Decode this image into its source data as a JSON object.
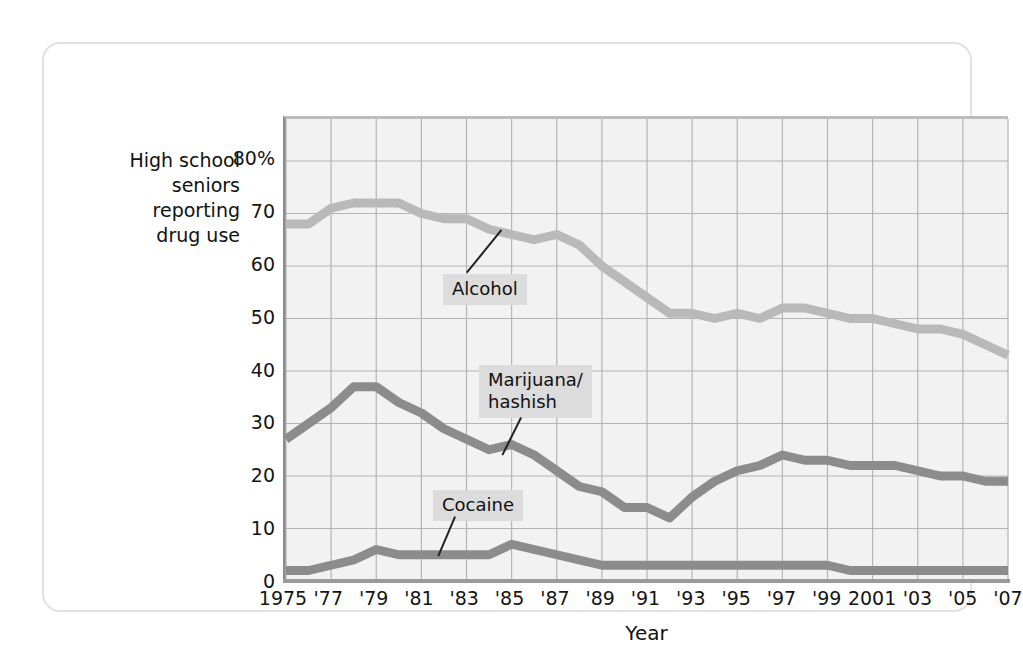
{
  "figure": {
    "y_axis_title": "High school\nseniors\nreporting\ndrug use",
    "x_axis_title": "Year",
    "frame_color": "#e2e2e2",
    "plot_background": "#f2f2f2",
    "grid_color": "#b4b4b4"
  },
  "callouts": {
    "alcohol": "Alcohol",
    "marijuana": "Marijuana/\nhashish",
    "cocaine": "Cocaine"
  },
  "chart_data": {
    "type": "line",
    "title": "",
    "xlabel": "Year",
    "ylabel": "High school seniors reporting drug use",
    "xlim": [
      1975,
      2007
    ],
    "ylim": [
      0,
      88
    ],
    "yticks": [
      0,
      10,
      20,
      30,
      40,
      50,
      60,
      70,
      80
    ],
    "ytick_labels": [
      "0",
      "10",
      "20",
      "30",
      "40",
      "50",
      "60",
      "70",
      "80%"
    ],
    "xticks": [
      1975,
      1977,
      1979,
      1981,
      1983,
      1985,
      1987,
      1989,
      1991,
      1993,
      1995,
      1997,
      1999,
      2001,
      2003,
      2005,
      2007
    ],
    "xtick_labels": [
      "1975",
      "'77",
      "'79",
      "'81",
      "'83",
      "'85",
      "'87",
      "'89",
      "'91",
      "'93",
      "'95",
      "'97",
      "'99",
      "2001",
      "'03",
      "'05",
      "'07"
    ],
    "grid": true,
    "legend_position": "inline-callouts",
    "x": [
      1975,
      1976,
      1977,
      1978,
      1979,
      1980,
      1981,
      1982,
      1983,
      1984,
      1985,
      1986,
      1987,
      1988,
      1989,
      1990,
      1991,
      1992,
      1993,
      1994,
      1995,
      1996,
      1997,
      1998,
      1999,
      2000,
      2001,
      2002,
      2003,
      2004,
      2005,
      2006,
      2007
    ],
    "series": [
      {
        "name": "Alcohol",
        "color": "#b9b9b9",
        "values": [
          68,
          68,
          71,
          72,
          72,
          72,
          70,
          69,
          69,
          67,
          66,
          65,
          66,
          64,
          60,
          57,
          54,
          51,
          51,
          50,
          51,
          50,
          52,
          52,
          51,
          50,
          50,
          49,
          48,
          48,
          47,
          45,
          43
        ]
      },
      {
        "name": "Marijuana/hashish",
        "color": "#8c8c8c",
        "values": [
          27,
          30,
          33,
          37,
          37,
          34,
          32,
          29,
          27,
          25,
          26,
          24,
          21,
          18,
          17,
          14,
          14,
          12,
          16,
          19,
          21,
          22,
          24,
          23,
          23,
          22,
          22,
          22,
          21,
          20,
          20,
          19,
          19
        ]
      },
      {
        "name": "Cocaine",
        "color": "#8c8c8c",
        "values": [
          2,
          2,
          3,
          4,
          6,
          5,
          5,
          5,
          5,
          5,
          7,
          6,
          5,
          4,
          3,
          3,
          3,
          3,
          3,
          3,
          3,
          3,
          3,
          3,
          3,
          2,
          2,
          2,
          2,
          2,
          2,
          2,
          2
        ]
      }
    ]
  }
}
